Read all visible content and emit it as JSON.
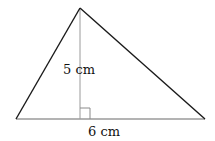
{
  "diagram": {
    "shape": "triangle",
    "labels": {
      "height": "5 cm",
      "base": "6 cm"
    },
    "colors": {
      "sides": "#1a1a1a",
      "base": "#999999",
      "height_line": "#999999",
      "right_angle_marker": "#888888",
      "background": "#ffffff"
    }
  }
}
